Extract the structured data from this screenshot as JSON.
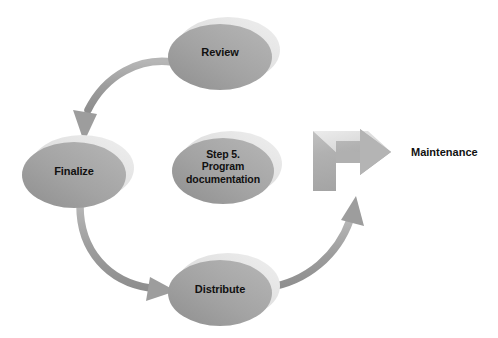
{
  "diagram": {
    "colors": {
      "background": "#ffffff",
      "node_fill_dark": "#9b9b9b",
      "node_fill_light": "#c9c9c9",
      "node_highlight": "#e3e3e3",
      "arrow_fill": "#a0a0a0",
      "arrow_highlight": "#d5d5d5",
      "block_arrow_fill": "#b0b0b0",
      "block_arrow_highlight": "#dedede",
      "text": "#111111"
    },
    "nodes": [
      {
        "id": "review",
        "label": "Review",
        "shape": "ellipse-3d",
        "cx": 220,
        "cy": 55,
        "rx": 52,
        "ry": 33
      },
      {
        "id": "finalize",
        "label": "Finalize",
        "shape": "ellipse-3d",
        "cx": 74,
        "cy": 174,
        "rx": 52,
        "ry": 33
      },
      {
        "id": "step5",
        "label": "Step 5.\nProgram\ndocumentation",
        "shape": "ellipse-3d",
        "cx": 223,
        "cy": 170,
        "rx": 51,
        "ry": 33
      },
      {
        "id": "distribute",
        "label": "Distribute",
        "shape": "ellipse-3d",
        "cx": 220,
        "cy": 292,
        "rx": 52,
        "ry": 33
      }
    ],
    "connectors": [
      {
        "id": "review-to-finalize",
        "from": "review",
        "to": "finalize",
        "style": "curved-arrow",
        "direction": "counterclockwise"
      },
      {
        "id": "finalize-to-distribute",
        "from": "finalize",
        "to": "distribute",
        "style": "curved-arrow",
        "direction": "counterclockwise"
      },
      {
        "id": "distribute-to-maintenance",
        "from": "distribute",
        "to": "maintenance",
        "style": "curved-arrow",
        "direction": "counterclockwise"
      }
    ],
    "block_arrow": {
      "id": "maintenance-block-arrow",
      "label": "",
      "direction": "right",
      "x": 313,
      "y": 131,
      "width": 78,
      "height": 60
    },
    "maintenance": {
      "label": "Maintenance"
    }
  }
}
